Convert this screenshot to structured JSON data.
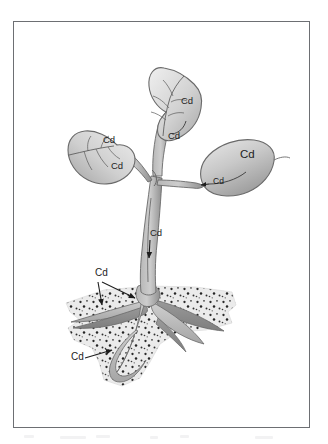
{
  "figure": {
    "frame_color": "#6d6f73",
    "background_color": "#ffffff"
  },
  "colors": {
    "leaf_light": "#e8e8e8",
    "leaf_mid": "#c9c9c9",
    "leaf_dark": "#a0a0a0",
    "outline": "#6a6a6a",
    "stem_light": "#c4c4c4",
    "stem_dark": "#8d8d8d",
    "root_light": "#c0c0c0",
    "root_dark": "#8b8b8b",
    "soil_fill": "#ebebeb",
    "soil_speckle": "#2b2b2b",
    "label_text": "#1d1d1d",
    "arrow": "#1d1d1d"
  },
  "labels": {
    "element_symbol": "Cd",
    "element_name": "Cadmium",
    "leaf_top_upper": "Cd",
    "leaf_top_lower": "Cd",
    "leaf_left_upper": "Cd",
    "leaf_left_lower": "Cd",
    "leaf_right_large": "Cd",
    "leaf_right_petiole": "Cd",
    "stem": "Cd",
    "soil_upper": "Cd",
    "soil_lower": "Cd"
  },
  "label_positions": {
    "leaf_top_upper": {
      "x": 181,
      "y": 104
    },
    "leaf_top_lower": {
      "x": 168,
      "y": 139
    },
    "leaf_left_upper": {
      "x": 103,
      "y": 143
    },
    "leaf_left_lower": {
      "x": 111,
      "y": 169
    },
    "leaf_right_large": {
      "x": 240,
      "y": 158
    },
    "leaf_right_petiole": {
      "x": 213,
      "y": 184
    },
    "stem": {
      "x": 150,
      "y": 236
    },
    "soil_upper": {
      "x": 95,
      "y": 276
    },
    "soil_lower": {
      "x": 71,
      "y": 360
    }
  },
  "annotations": {
    "count": 9,
    "arrow_count": 5,
    "arrows": [
      {
        "name": "stem-arrow",
        "from": "stem-label",
        "to": "stem-interior",
        "direction": "down"
      },
      {
        "name": "leaf-right-arrow",
        "from": "leaf-right-label",
        "to": "petiole-junction",
        "direction": "left"
      },
      {
        "name": "soil-upper-arrow-left",
        "from": "soil-upper-label",
        "to": "lateral-root-left",
        "direction": "down-right"
      },
      {
        "name": "soil-upper-arrow-right",
        "from": "soil-upper-label",
        "to": "root-crown",
        "direction": "down-right"
      },
      {
        "name": "soil-lower-arrow",
        "from": "soil-lower-label",
        "to": "lower-root",
        "direction": "right"
      }
    ]
  },
  "parts": {
    "leaf_top": "top-leaf",
    "leaf_left": "left-leaf",
    "leaf_right": "right-leaf",
    "stem": "main-stem",
    "soil": "soil-layer",
    "roots": "root-system"
  }
}
